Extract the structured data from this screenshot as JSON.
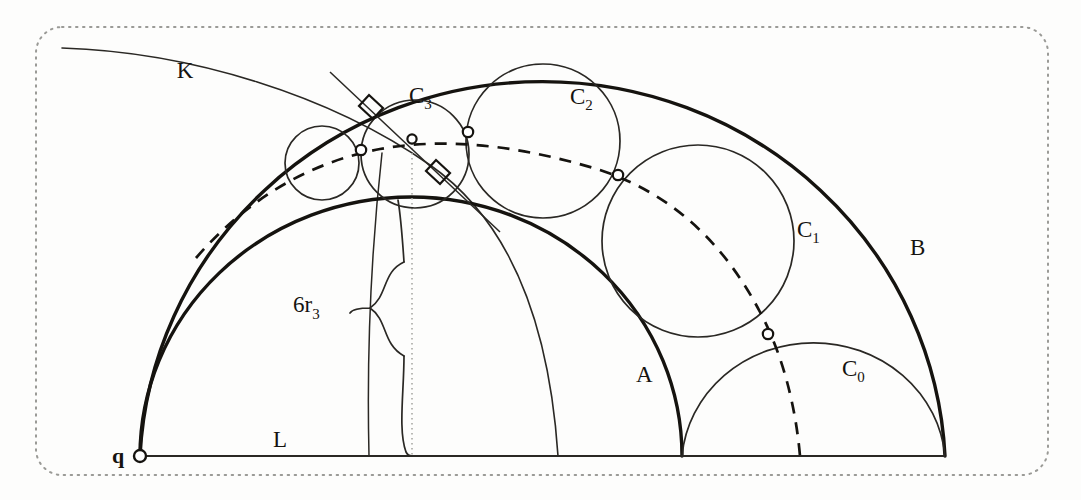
{
  "figure": {
    "kind": "geometry-diagram",
    "title_visible": false,
    "background_color": "#fdfdfc",
    "ink_color": "#15130f",
    "border": {
      "name": "dotted-rounded-border",
      "style": "dotted",
      "color": "#9a9a96",
      "corner_radius": 26
    },
    "labels": [
      {
        "id": "K",
        "text": "K",
        "sub": "",
        "x": 185,
        "y": 78
      },
      {
        "id": "C3",
        "text": "C",
        "sub": "3",
        "x": 409,
        "y": 103
      },
      {
        "id": "C2",
        "text": "C",
        "sub": "2",
        "x": 570,
        "y": 104
      },
      {
        "id": "C1",
        "text": "C",
        "sub": "1",
        "x": 797,
        "y": 237
      },
      {
        "id": "C0",
        "text": "C",
        "sub": "0",
        "x": 842,
        "y": 376
      },
      {
        "id": "B",
        "text": "B",
        "sub": "",
        "x": 910,
        "y": 255
      },
      {
        "id": "A",
        "text": "A",
        "sub": "",
        "x": 636,
        "y": 382
      },
      {
        "id": "L",
        "text": "L",
        "sub": "",
        "x": 273,
        "y": 447
      },
      {
        "id": "q",
        "text": "q",
        "sub": "",
        "x": 119,
        "y": 461
      },
      {
        "id": "6r3",
        "text": "6r",
        "sub": "3",
        "x": 305,
        "y": 314
      }
    ],
    "baseline": {
      "name": "line-L",
      "from_x": 140,
      "from_y": 456,
      "to_x": 945,
      "to_y": 456
    },
    "semicircle_B": {
      "cx": 542,
      "cy": 456,
      "r": 403,
      "label": "B",
      "stroke_width": 3.2
    },
    "semicircle_A": {
      "cx": 411,
      "cy": 456,
      "r": 271,
      "label": "A",
      "stroke_width": 3.2
    },
    "semicircle_C0": {
      "cx": 813,
      "cy": 456,
      "r": 132,
      "label": "C0",
      "stroke_width": 1.6
    },
    "chain_circles": [
      {
        "name": "C1",
        "cx": 698,
        "cy": 241,
        "r": 96
      },
      {
        "name": "C2",
        "cx": 543,
        "cy": 141,
        "r": 77
      },
      {
        "name": "C3",
        "cx": 415,
        "cy": 154,
        "r": 54
      },
      {
        "name": "C4",
        "cx": 322,
        "cy": 163,
        "r": 37
      }
    ],
    "tangency_points": [
      {
        "name": "t0",
        "x": 768,
        "y": 334
      },
      {
        "name": "t1",
        "x": 618,
        "y": 175
      },
      {
        "name": "t2",
        "x": 468,
        "y": 132
      },
      {
        "name": "t3",
        "x": 361,
        "y": 150
      },
      {
        "name": "tq",
        "x": 140,
        "y": 456
      },
      {
        "name": "tc",
        "x": 412,
        "y": 140
      }
    ],
    "dashed_arc": {
      "name": "dashed-circle-through-tangencies",
      "cx": 456,
      "cy": 478,
      "r": 352,
      "dash": "11 9",
      "stroke_width": 2.6
    },
    "curve_K": {
      "name": "curve-K",
      "description": "thin circular arc from upper-left sweeping down through C3 to the baseline",
      "cx": 1042,
      "cy": 720,
      "r": 1000,
      "stroke_width": 1.5
    },
    "curve_K2": {
      "name": "curve-K-inner",
      "description": "second thin arc descending to baseline near x=558",
      "stroke_width": 1.5
    },
    "dotted_vertical": {
      "name": "vertical-dotted-axis",
      "x": 412,
      "y_top": 140,
      "y_bottom": 456,
      "color": "#aaaaa6"
    },
    "brace": {
      "name": "measure-brace-6r3",
      "orientation": "right-facing",
      "x": 372,
      "y_top": 261,
      "y_bottom": 456,
      "tip_x": 352
    },
    "right_angle_marks": [
      {
        "name": "right-angle-upper-left",
        "x": 377,
        "y": 105,
        "rot": -30
      },
      {
        "name": "right-angle-lower-right",
        "x": 447,
        "y": 178,
        "rot": -30
      }
    ]
  }
}
